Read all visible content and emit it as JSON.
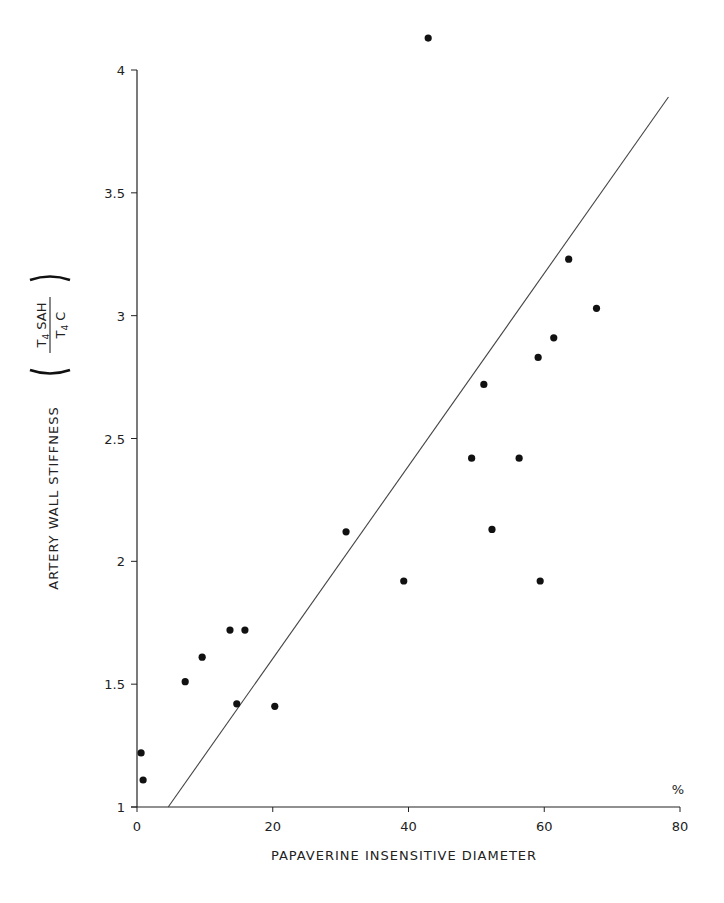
{
  "chart_data": {
    "type": "scatter",
    "title": "",
    "xlabel": "PAPAVERINE INSENSITIVE DIAMETER",
    "x_unit": "%",
    "ylabel": "ARTERY WALL STIFFNESS",
    "ylabel_fraction": {
      "numerator": {
        "symbol": "T",
        "subscript": "4",
        "text": "SAH"
      },
      "denominator": {
        "symbol": "T",
        "subscript": "4",
        "text": "C"
      }
    },
    "xlim": [
      0,
      80
    ],
    "ylim": [
      1,
      4
    ],
    "x_ticks": [
      0,
      20,
      40,
      60,
      80
    ],
    "x_tick_labels": [
      "0",
      "20",
      "40",
      "60",
      "80"
    ],
    "y_ticks": [
      1,
      1.5,
      2,
      2.5,
      3,
      3.5,
      4
    ],
    "y_tick_labels": [
      "1",
      "1.5",
      "2",
      "2.5",
      "3",
      "3.5",
      "4"
    ],
    "grid": false,
    "legend": null,
    "series": [
      {
        "name": "data points",
        "points": [
          {
            "x": 0.6,
            "y": 1.22
          },
          {
            "x": 0.9,
            "y": 1.11
          },
          {
            "x": 7.1,
            "y": 1.51
          },
          {
            "x": 9.6,
            "y": 1.61
          },
          {
            "x": 13.7,
            "y": 1.72
          },
          {
            "x": 15.9,
            "y": 1.72
          },
          {
            "x": 14.7,
            "y": 1.42
          },
          {
            "x": 20.3,
            "y": 1.41
          },
          {
            "x": 30.8,
            "y": 2.12
          },
          {
            "x": 39.3,
            "y": 1.92
          },
          {
            "x": 42.9,
            "y": 4.13
          },
          {
            "x": 49.3,
            "y": 2.42
          },
          {
            "x": 51.1,
            "y": 2.72
          },
          {
            "x": 52.3,
            "y": 2.13
          },
          {
            "x": 56.3,
            "y": 2.42
          },
          {
            "x": 59.1,
            "y": 2.83
          },
          {
            "x": 59.4,
            "y": 1.92
          },
          {
            "x": 61.4,
            "y": 2.91
          },
          {
            "x": 63.6,
            "y": 3.23
          },
          {
            "x": 67.7,
            "y": 3.03
          }
        ]
      }
    ],
    "regression_line": {
      "x1": 4.6,
      "y1": 1.0,
      "x2": 78.3,
      "y2": 3.89
    },
    "colors": {
      "points": "#111111",
      "axes": "#222222",
      "line": "#444444"
    }
  }
}
